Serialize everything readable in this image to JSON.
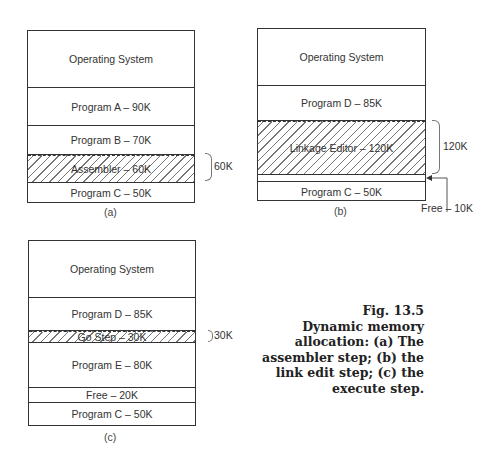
{
  "diagrams": {
    "a": {
      "label": "(a)",
      "segments": [
        {
          "label": "Operating System",
          "hatched": false
        },
        {
          "label": "Program A – 90K",
          "hatched": false
        },
        {
          "label": "Program B – 70K",
          "hatched": false
        },
        {
          "label": "Assembler – 60K",
          "hatched": true
        },
        {
          "label": "Program C – 50K",
          "hatched": false
        }
      ],
      "brace_label": "60K"
    },
    "b": {
      "label": "(b)",
      "segments": [
        {
          "label": "Operating System",
          "hatched": false
        },
        {
          "label": "Program D – 85K",
          "hatched": false
        },
        {
          "label": "Linkage Editor – 120K",
          "hatched": true
        },
        {
          "label": "",
          "hatched": false
        },
        {
          "label": "Program C – 50K",
          "hatched": false
        }
      ],
      "brace_label": "120K",
      "free_label": "Free – 10K"
    },
    "c": {
      "label": "(c)",
      "segments": [
        {
          "label": "Operating System",
          "hatched": false
        },
        {
          "label": "Program D – 85K",
          "hatched": false
        },
        {
          "label": "Go Step – 30K",
          "hatched": true
        },
        {
          "label": "Program E – 80K",
          "hatched": false
        },
        {
          "label": "Free – 20K",
          "hatched": false
        },
        {
          "label": "Program C – 50K",
          "hatched": false
        }
      ],
      "brace_label": "30K"
    }
  },
  "caption": {
    "lines": [
      "Fig.  13.5",
      "Dynamic memory",
      "allocation: (a) The",
      "assembler step; (b) the",
      "link edit step; (c) the",
      "execute step."
    ]
  }
}
